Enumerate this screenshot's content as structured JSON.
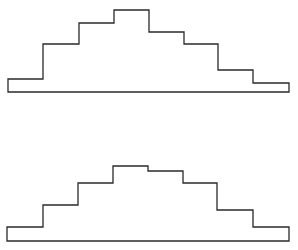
{
  "diagram": {
    "stroke_color": "#2a2a2a",
    "background": "#ffffff",
    "shapes": [
      {
        "name": "top-step-profile",
        "baseline_y": 92,
        "x_edges": [
          8,
          43,
          79,
          114,
          149,
          184,
          218,
          253,
          289
        ],
        "step_tops_y": [
          79,
          44,
          23,
          10,
          32,
          44,
          70,
          83
        ]
      },
      {
        "name": "bottom-step-profile",
        "baseline_y": 241,
        "x_edges": [
          7,
          43,
          78,
          113,
          148,
          183,
          217,
          253,
          289
        ],
        "step_tops_y": [
          227,
          205,
          183,
          166,
          171,
          183,
          210,
          227
        ]
      }
    ]
  }
}
